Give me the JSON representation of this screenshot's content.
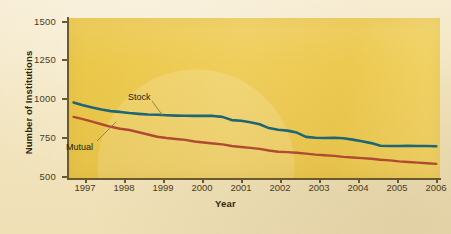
{
  "chart_data": {
    "type": "line",
    "title": "",
    "xlabel": "Year",
    "ylabel": "Number of Institutions",
    "categories": [
      1997,
      1998,
      1999,
      2000,
      2001,
      2002,
      2003,
      2004,
      2005,
      2006
    ],
    "x_tick_labels": [
      "1997",
      "1998",
      "1999",
      "2000",
      "2001",
      "2002",
      "2003",
      "2004",
      "2005",
      "2006"
    ],
    "y_tick_labels": [
      "1500",
      "1250",
      "1000",
      "750",
      "500"
    ],
    "y_tick_values": [
      1500,
      1250,
      1000,
      750,
      500
    ],
    "ylim": [
      500,
      1500
    ],
    "xlim": [
      1996.6,
      2006.6
    ],
    "grid": false,
    "legend_position": "inline-annotations",
    "series": [
      {
        "name": "Stock",
        "color": "#1e6575",
        "label_text": "Stock",
        "values": [
          970,
          918,
          895,
          888,
          862,
          812,
          757,
          752,
          702,
          700
        ],
        "dense_x": [
          1996.75,
          1997.0,
          1997.25,
          1997.5,
          1997.75,
          1998.0,
          1998.25,
          1998.5,
          1998.75,
          1999.0,
          1999.25,
          1999.5,
          1999.75,
          2000.0,
          2000.25,
          2000.5,
          2000.75,
          2001.0,
          2001.25,
          2001.5,
          2001.75,
          2002.0,
          2002.25,
          2002.5,
          2002.75,
          2003.0,
          2003.25,
          2003.5,
          2003.75,
          2004.0,
          2004.25,
          2004.5,
          2004.75,
          2005.0,
          2005.25,
          2005.5,
          2005.75,
          2006.0,
          2006.25,
          2006.5
        ],
        "dense_y": [
          972,
          955,
          940,
          928,
          918,
          913,
          906,
          901,
          897,
          895,
          892,
          890,
          889,
          888,
          888,
          888,
          882,
          862,
          858,
          848,
          836,
          812,
          802,
          796,
          784,
          757,
          752,
          750,
          752,
          748,
          740,
          730,
          718,
          702,
          700,
          700,
          702,
          700,
          700,
          698
        ]
      },
      {
        "name": "Mutual",
        "color": "#b14a32",
        "label_text": "Mutual",
        "values": [
          880,
          808,
          758,
          728,
          700,
          672,
          652,
          632,
          614,
          596
        ],
        "dense_x": [
          1996.75,
          1997.0,
          1997.25,
          1997.5,
          1997.75,
          1998.0,
          1998.25,
          1998.5,
          1998.75,
          1999.0,
          1999.25,
          1999.5,
          1999.75,
          2000.0,
          2000.25,
          2000.5,
          2000.75,
          2001.0,
          2001.25,
          2001.5,
          2001.75,
          2002.0,
          2002.25,
          2002.5,
          2002.75,
          2003.0,
          2003.25,
          2003.5,
          2003.75,
          2004.0,
          2004.25,
          2004.5,
          2004.75,
          2005.0,
          2005.25,
          2005.5,
          2005.75,
          2006.0,
          2006.25,
          2006.5
        ],
        "dense_y": [
          882,
          868,
          852,
          836,
          820,
          808,
          800,
          786,
          772,
          758,
          750,
          744,
          738,
          728,
          722,
          716,
          710,
          700,
          694,
          688,
          682,
          672,
          664,
          662,
          658,
          652,
          646,
          642,
          638,
          632,
          628,
          624,
          620,
          614,
          610,
          604,
          600,
          596,
          592,
          588
        ]
      }
    ],
    "colors": {
      "plot_background": "#eec94f",
      "page_background": "#f3e7c4",
      "axis": "#6b5a2e",
      "text": "#4a3c1c",
      "stock_line": "#1e6575",
      "mutual_line": "#b14a32"
    }
  }
}
